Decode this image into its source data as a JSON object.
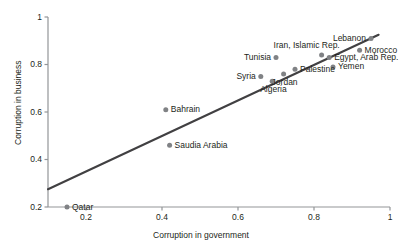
{
  "chart_data": {
    "type": "scatter",
    "title": "",
    "xlabel": "Corruption in government",
    "ylabel": "Corruption in business",
    "xlim": [
      0.1,
      1.0
    ],
    "ylim": [
      0.2,
      1.0
    ],
    "xticks": [
      "0.2",
      "0.4",
      "0.6",
      "0.8",
      "1"
    ],
    "xtick_values": [
      0.2,
      0.4,
      0.6,
      0.8,
      1.0
    ],
    "yticks": [
      "0.2",
      "0.4",
      "0.6",
      "0.8",
      "1"
    ],
    "ytick_values": [
      0.2,
      0.4,
      0.6,
      0.8,
      1.0
    ],
    "grid": false,
    "legend": "none",
    "marker_color": "#808285",
    "line_color": "#414042",
    "points": [
      {
        "label": "Qatar",
        "x": 0.15,
        "y": 0.2,
        "label_pos": "right"
      },
      {
        "label": "Saudia Arabia",
        "x": 0.42,
        "y": 0.46,
        "label_pos": "right"
      },
      {
        "label": "Bahrain",
        "x": 0.41,
        "y": 0.61,
        "label_pos": "right"
      },
      {
        "label": "Syria",
        "x": 0.66,
        "y": 0.75,
        "label_pos": "left"
      },
      {
        "label": "Algeria",
        "x": 0.69,
        "y": 0.73,
        "label_pos": "below"
      },
      {
        "label": "Jordan",
        "x": 0.72,
        "y": 0.76,
        "label_pos": "below"
      },
      {
        "label": "Tunisia",
        "x": 0.7,
        "y": 0.83,
        "label_pos": "left"
      },
      {
        "label": "Palestine",
        "x": 0.75,
        "y": 0.78,
        "label_pos": "right"
      },
      {
        "label": "Iran, Islamic Rep.",
        "x": 0.82,
        "y": 0.84,
        "label_pos": "above"
      },
      {
        "label": "Egypt, Arab Rep.",
        "x": 0.84,
        "y": 0.83,
        "label_pos": "right"
      },
      {
        "label": "Yemen",
        "x": 0.85,
        "y": 0.79,
        "label_pos": "right"
      },
      {
        "label": "Morocco",
        "x": 0.92,
        "y": 0.86,
        "label_pos": "right"
      },
      {
        "label": "Lebanon",
        "x": 0.95,
        "y": 0.91,
        "label_pos": "left"
      }
    ],
    "trendline": {
      "x0": 0.1,
      "y0": 0.275,
      "x1": 0.97,
      "y1": 0.925
    }
  }
}
